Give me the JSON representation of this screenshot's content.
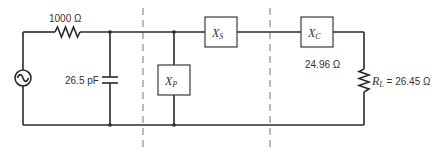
{
  "diagram": {
    "type": "circuit-schematic",
    "source": {
      "symbol": "ac-source"
    },
    "source_resistor": {
      "label": "1000 Ω"
    },
    "shunt_capacitor": {
      "label": "26.5 pF"
    },
    "shunt_reactance": {
      "symbol": "X",
      "subscript": "P"
    },
    "series_reactance": {
      "symbol": "X",
      "subscript": "S"
    },
    "load_reactance": {
      "symbol": "X",
      "subscript": "C",
      "value_label": "24.96 Ω"
    },
    "load_resistor": {
      "symbol": "R",
      "subscript": "L",
      "equals": " = ",
      "value": "26.45 Ω"
    },
    "dashed_section_dividers": 2
  },
  "colors": {
    "wire": "#2a2a2a",
    "divider": "#8a8a8a",
    "background": "#ffffff"
  }
}
